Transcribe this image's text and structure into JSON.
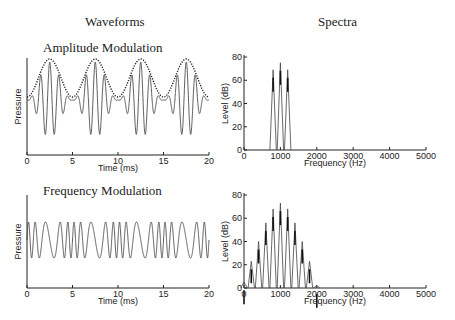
{
  "columns": {
    "left": "Waveforms",
    "right": "Spectra"
  },
  "chart_data": [
    {
      "type": "line",
      "title": "Amplitude Modulation",
      "xlabel": "Time (ms)",
      "ylabel": "Pressure",
      "xlim": [
        0,
        20
      ],
      "xticks": [
        0,
        5,
        10,
        15,
        20
      ],
      "series": [
        {
          "name": "AM waveform",
          "description": "1000 Hz carrier modulated at 200 Hz (100% depth)",
          "carrier_hz": 1000,
          "modulation_hz": 200
        },
        {
          "name": "envelope",
          "style": "dotted",
          "period_ms": 5,
          "peaks_ms": [
            2.5,
            7.5,
            12.5,
            17.5
          ]
        }
      ]
    },
    {
      "type": "bar",
      "title": "Amplitude Modulation Spectrum",
      "xlabel": "Frequency (Hz)",
      "ylabel": "Level (dB)",
      "xlim": [
        0,
        5000
      ],
      "ylim": [
        0,
        80
      ],
      "xticks": [
        0,
        1000,
        2000,
        3000,
        4000,
        5000
      ],
      "yticks": [
        0,
        20,
        40,
        60,
        80
      ],
      "categories": [
        800,
        1000,
        1200
      ],
      "values": [
        69,
        75,
        69
      ]
    },
    {
      "type": "line",
      "title": "Frequency Modulation",
      "xlabel": "Time (ms)",
      "ylabel": "Pressure",
      "xlim": [
        0,
        20
      ],
      "xticks": [
        0,
        5,
        10,
        15,
        20
      ],
      "series": [
        {
          "name": "FM waveform",
          "description": "1000 Hz carrier, frequency modulated at 200 Hz, constant amplitude",
          "carrier_hz": 1000,
          "modulation_hz": 200
        }
      ]
    },
    {
      "type": "bar",
      "title": "Frequency Modulation Spectrum",
      "xlabel": "Frequency (Hz)",
      "ylabel": "Level (dB)",
      "xlim": [
        0,
        5000
      ],
      "ylim": [
        0,
        80
      ],
      "xticks": [
        0,
        1000,
        2000,
        3000,
        4000,
        5000
      ],
      "yticks": [
        0,
        20,
        40,
        60,
        80
      ],
      "categories": [
        0,
        200,
        400,
        600,
        800,
        1000,
        1200,
        1400,
        1600,
        1800,
        2000
      ],
      "values": [
        5,
        23,
        40,
        56,
        68,
        73,
        68,
        56,
        40,
        23,
        2
      ]
    }
  ]
}
